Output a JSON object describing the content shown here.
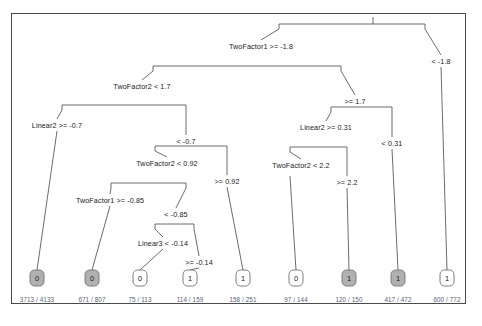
{
  "figure": {
    "type": "decision-tree-diagram",
    "border_color": "#4a4a4a",
    "background": "#ffffff",
    "leaf_shaded_fill": "#b0b0b0",
    "leaf_count_color": "#555f7a"
  },
  "chart_data": {
    "type": "diagram",
    "title": "",
    "splits": [
      {
        "id": "root",
        "label": "TwoFactor1 >= -1.8",
        "x": 261,
        "y": 46
      },
      {
        "id": "s2",
        "label": "TwoFactor2 < 1.7",
        "x": 142,
        "y": 86
      },
      {
        "id": "s3",
        "label": "Linear2 >= -0.7",
        "x": 57,
        "y": 125
      },
      {
        "id": "s4",
        "label": "< -0.7",
        "x": 186,
        "y": 141
      },
      {
        "id": "s5",
        "label": "TwoFactor2 < 0.92",
        "x": 167,
        "y": 163
      },
      {
        "id": "s6",
        "label": ">= 0.92",
        "x": 227,
        "y": 181
      },
      {
        "id": "s7",
        "label": "TwoFactor1 >= -0.85",
        "x": 110,
        "y": 200
      },
      {
        "id": "s8",
        "label": "< -0.85",
        "x": 176,
        "y": 214
      },
      {
        "id": "s9",
        "label": "Linear3 < -0.14",
        "x": 163,
        "y": 243
      },
      {
        "id": "s10",
        "label": ">= -0.14",
        "x": 199,
        "y": 262
      },
      {
        "id": "s11",
        "label": ">= 1.7",
        "x": 355,
        "y": 101
      },
      {
        "id": "s12",
        "label": "Linear2 >= 0.31",
        "x": 326,
        "y": 127
      },
      {
        "id": "s13",
        "label": "< 0.31",
        "x": 392,
        "y": 143
      },
      {
        "id": "s14",
        "label": "TwoFactor2 < 2.2",
        "x": 301,
        "y": 165
      },
      {
        "id": "s15",
        "label": ">= 2.2",
        "x": 347,
        "y": 182
      },
      {
        "id": "s16",
        "label": "< -1.8",
        "x": 441,
        "y": 61
      }
    ],
    "leaves": [
      {
        "id": "l1",
        "class": "0",
        "shaded": true,
        "count": "3713 / 4133",
        "x": 37,
        "y": 278
      },
      {
        "id": "l2",
        "class": "0",
        "shaded": true,
        "count": "671 / 807",
        "x": 92,
        "y": 278
      },
      {
        "id": "l3",
        "class": "0",
        "shaded": false,
        "count": "75 / 113",
        "x": 140,
        "y": 278
      },
      {
        "id": "l4",
        "class": "1",
        "shaded": false,
        "count": "114 / 159",
        "x": 190,
        "y": 278
      },
      {
        "id": "l5",
        "class": "1",
        "shaded": false,
        "count": "158 / 251",
        "x": 243,
        "y": 278
      },
      {
        "id": "l6",
        "class": "0",
        "shaded": false,
        "count": "97 / 144",
        "x": 296,
        "y": 278
      },
      {
        "id": "l7",
        "class": "1",
        "shaded": true,
        "count": "120 / 150",
        "x": 349,
        "y": 278
      },
      {
        "id": "l8",
        "class": "1",
        "shaded": true,
        "count": "417 / 472",
        "x": 398,
        "y": 278
      },
      {
        "id": "l9",
        "class": "1",
        "shaded": false,
        "count": "600 / 772",
        "x": 447,
        "y": 278
      }
    ],
    "edges": [
      {
        "from": "stem-top",
        "path": "M 373,17 L 373,24"
      },
      {
        "from": "root-bracket",
        "path": "M 279,29 L 279,24 L 425,24 L 425,29"
      },
      {
        "from": "root-left",
        "path": "M 279,29 L 261,40"
      },
      {
        "from": "root-right",
        "path": "M 425,29 L 441,55"
      },
      {
        "from": "neg18-leaf",
        "path": "M 441,67 L 447,270"
      },
      {
        "from": "l2-bracket",
        "path": "M 153,71 L 153,66 L 341,66 L 341,71"
      },
      {
        "from": "l2-left",
        "path": "M 153,71 L 142,80"
      },
      {
        "from": "l2-right",
        "path": "M 341,71 L 355,95"
      },
      {
        "from": "l3-bracket",
        "path": "M 62,110 L 62,105 L 186,105 L 186,110"
      },
      {
        "from": "l3-left",
        "path": "M 62,110 L 57,119"
      },
      {
        "from": "l3-right",
        "path": "M 186,110 L 186,135"
      },
      {
        "from": "l4-bracket",
        "path": "M 155,151 L 155,146 L 227,146 L 227,151"
      },
      {
        "from": "l4-left",
        "path": "M 155,151 L 167,157"
      },
      {
        "from": "l4-right",
        "path": "M 227,151 L 227,175"
      },
      {
        "from": "l5-bracket",
        "path": "M 111,188 L 111,183 L 186,183 L 186,188"
      },
      {
        "from": "l5-left",
        "path": "M 111,188 L 110,194"
      },
      {
        "from": "l5-right",
        "path": "M 186,188 L 176,208"
      },
      {
        "from": "l6-bracket",
        "path": "M 155,229 L 155,224 L 194,224 L 194,229"
      },
      {
        "from": "l6-left",
        "path": "M 155,229 L 163,237"
      },
      {
        "from": "l6-right",
        "path": "M 194,229 L 199,256"
      },
      {
        "from": "leaf1-line",
        "path": "M 57,131 L 37,270"
      },
      {
        "from": "leaf2-line",
        "path": "M 110,206 L 92,270"
      },
      {
        "from": "leaf3-line",
        "path": "M 163,249 L 140,270"
      },
      {
        "from": "leaf4-line",
        "path": "M 199,268 L 190,270"
      },
      {
        "from": "leaf5-line",
        "path": "M 227,187 L 243,270"
      },
      {
        "from": "leaf6-line",
        "path": "M 290,176 L 296,270"
      },
      {
        "from": "leaf7-line",
        "path": "M 347,188 L 349,270"
      },
      {
        "from": "leaf8-line",
        "path": "M 392,149 L 398,270"
      },
      {
        "from": "r1-bracket",
        "path": "M 331,112 L 331,107 L 392,107 L 392,112"
      },
      {
        "from": "r1-left",
        "path": "M 331,112 L 326,121"
      },
      {
        "from": "r1-right",
        "path": "M 392,112 L 392,137"
      },
      {
        "from": "r2-bracket",
        "path": "M 290,152 L 290,147 L 347,147 L 347,152"
      },
      {
        "from": "r2-left",
        "path": "M 290,152 L 301,159"
      },
      {
        "from": "r2-right",
        "path": "M 347,152 L 347,176"
      }
    ]
  }
}
